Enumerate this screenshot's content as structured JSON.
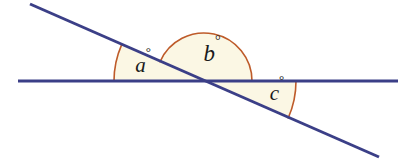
{
  "figure": {
    "width": 411,
    "height": 163,
    "background_color": "#FFFFFF"
  },
  "colors": {
    "line": "#3B3F87",
    "arc": "#BE5B2A",
    "fill": "#FBF7E4",
    "label_text": "#1A1A1A"
  },
  "vertex": {
    "x": 204,
    "y": 81
  },
  "lines": [
    {
      "name": "horizontal-line",
      "x1": 18,
      "y1": 81,
      "x2": 398,
      "y2": 81,
      "stroke_width": 3
    },
    {
      "name": "transversal-line",
      "x1": 30,
      "y1": 4,
      "x2": 379,
      "y2": 157,
      "stroke_width": 3
    }
  ],
  "angles": [
    {
      "id": "a",
      "label": "a",
      "degree_symbol": "°",
      "label_x": 143,
      "label_y": 67,
      "font_size": 21,
      "radius": 90,
      "start_angle_deg": 180,
      "end_angle_deg": 203.7,
      "arc_stroke_width": 1.6
    },
    {
      "id": "b",
      "label": "b",
      "degree_symbol": "°",
      "label_x": 212,
      "label_y": 56,
      "font_size": 23,
      "radius": 48,
      "start_angle_deg": 203.7,
      "end_angle_deg": 360,
      "arc_stroke_width": 1.6
    },
    {
      "id": "c",
      "label": "c",
      "degree_symbol": "°",
      "label_x": 277,
      "label_y": 95,
      "font_size": 21,
      "radius": 92,
      "start_angle_deg": 0,
      "end_angle_deg": 23.7,
      "arc_stroke_width": 1.6
    }
  ]
}
